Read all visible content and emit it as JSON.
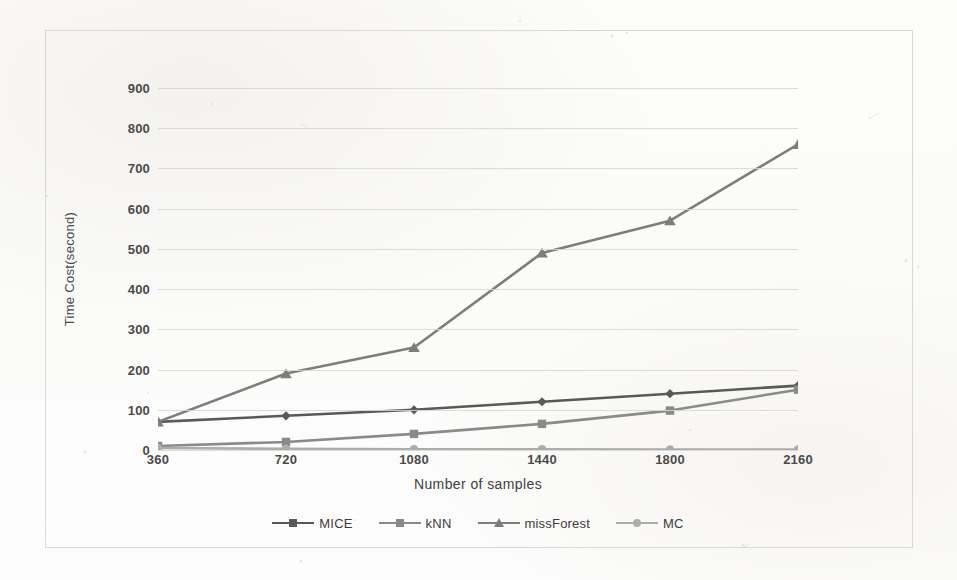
{
  "chart_data": {
    "type": "line",
    "title": "",
    "xlabel": "Number of samples",
    "ylabel": "Time Cost(second)",
    "categories": [
      "360",
      "720",
      "1080",
      "1440",
      "1800",
      "2160"
    ],
    "x": [
      360,
      720,
      1080,
      1440,
      1800,
      2160
    ],
    "ylim": [
      0,
      900
    ],
    "yticks": [
      "900",
      "800",
      "700",
      "600",
      "500",
      "400",
      "300",
      "200",
      "100",
      "0"
    ],
    "ytick_values": [
      900,
      800,
      700,
      600,
      500,
      400,
      300,
      200,
      100,
      0
    ],
    "grid": true,
    "legend_position": "bottom",
    "series": [
      {
        "name": "MICE",
        "marker": "diamond",
        "color": "#595958",
        "values": [
          70,
          85,
          100,
          120,
          140,
          160
        ]
      },
      {
        "name": "kNN",
        "marker": "square",
        "color": "#8a8a88",
        "values": [
          10,
          20,
          40,
          65,
          98,
          150
        ]
      },
      {
        "name": "missForest",
        "marker": "triangle",
        "color": "#7d7d7b",
        "values": [
          70,
          190,
          255,
          490,
          570,
          760
        ]
      },
      {
        "name": "MC",
        "marker": "circle",
        "color": "#adadab",
        "values": [
          5,
          3,
          2,
          2,
          1,
          1
        ]
      }
    ]
  },
  "figure": {
    "background_color": "#fdfdfc",
    "frame_color": "#d8d8d6",
    "gridline_color": "#d6d6d4",
    "tick_text_color": "#4a4a48"
  }
}
